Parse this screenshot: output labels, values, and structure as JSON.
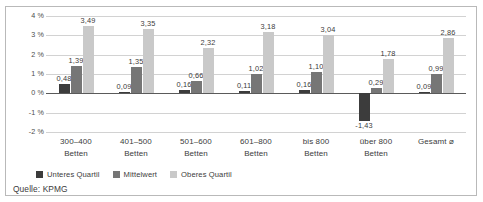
{
  "source_note": "Quelle: KPMG",
  "colors": {
    "unteres_quartil": "#3c3c3c",
    "mittelwert": "#767676",
    "oberes_quartil": "#c9c9c9",
    "gridline": "#d2d2d2",
    "axis": "#5a5a5a",
    "frame": "#b9b9b9",
    "background": "#ffffff",
    "text": "#3b3b3b"
  },
  "legend": {
    "position": "bottom-left",
    "items": [
      {
        "label": "Unteres Quartil",
        "color": "#3c3c3c"
      },
      {
        "label": "Mittelwert",
        "color": "#767676"
      },
      {
        "label": "Oberes Quartil",
        "color": "#c9c9c9"
      }
    ]
  },
  "chart_data": {
    "type": "bar",
    "title": "",
    "subtitle": "",
    "xlabel": "",
    "ylabel": "",
    "ylim": [
      -2,
      4
    ],
    "yticks": [
      4,
      3,
      2,
      1,
      0,
      -1,
      -2
    ],
    "ytick_labels": [
      "4 %",
      "3 %",
      "2 %",
      "1 %",
      "0 %",
      "-1 %",
      "-2 %"
    ],
    "grid": true,
    "legend_position": "bottom-left",
    "categories": [
      "300–400\nBetten",
      "401–500\nBetten",
      "501–600\nBetten",
      "601–800\nBetten",
      "bis 800\nBetten",
      "über 800\nBetten",
      "Gesamt ⌀"
    ],
    "category_lines": [
      [
        "300–400",
        "Betten"
      ],
      [
        "401–500",
        "Betten"
      ],
      [
        "501–600",
        "Betten"
      ],
      [
        "601–800",
        "Betten"
      ],
      [
        "bis 800",
        "Betten"
      ],
      [
        "über 800",
        "Betten"
      ],
      [
        "Gesamt ⌀",
        ""
      ]
    ],
    "series": [
      {
        "name": "Unteres Quartil",
        "color": "#3c3c3c",
        "values": [
          0.48,
          0.09,
          0.16,
          0.11,
          0.16,
          -1.43,
          0.09
        ],
        "labels": [
          "0,48",
          "0,09",
          "0,16",
          "0,11",
          "0,16",
          "-1,43",
          "0,09"
        ]
      },
      {
        "name": "Mittelwert",
        "color": "#767676",
        "values": [
          1.39,
          1.35,
          0.66,
          1.02,
          1.1,
          0.29,
          0.99
        ],
        "labels": [
          "1,39",
          "1,35",
          "0,66",
          "1,02",
          "1,10",
          "0,29",
          "0,99"
        ]
      },
      {
        "name": "Oberes Quartil",
        "color": "#c9c9c9",
        "values": [
          3.49,
          3.35,
          2.32,
          3.18,
          3.04,
          1.78,
          2.86
        ],
        "labels": [
          "3,49",
          "3,35",
          "2,32",
          "3,18",
          "3,04",
          "1,78",
          "2,86"
        ]
      }
    ]
  }
}
